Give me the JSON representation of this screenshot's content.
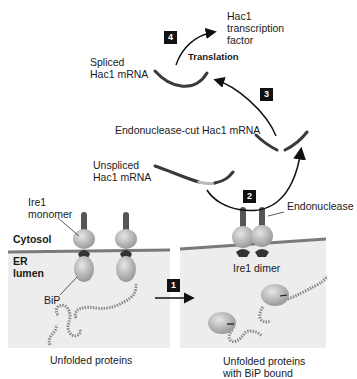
{
  "diagram": {
    "colors": {
      "lumen_fill": "#ececec",
      "membrane": "#7a7a7a",
      "mrna": "#3a3a3a",
      "protein_globe": "#b8b8b8",
      "ire1_stalk": "#555555",
      "step_badge": "#111111"
    },
    "compartments": {
      "cytosol": "Cytosol",
      "er_lumen_line1": "ER",
      "er_lumen_line2": "lumen"
    },
    "labels": {
      "ire1_monomer_line1": "Ire1",
      "ire1_monomer_line2": "monomer",
      "bip": "BiP",
      "unfolded_proteins": "Unfolded proteins",
      "unfolded_bip_line1": "Unfolded proteins",
      "unfolded_bip_line2": "with BiP bound",
      "ire1_dimer": "Ire1 dimer",
      "endonuclease": "Endonuclease",
      "unspliced_line1": "Unspliced",
      "unspliced_line2": "Hac1 mRNA",
      "cut_mrna": "Endonuclease-cut Hac1 mRNA",
      "spliced_line1": "Spliced",
      "spliced_line2": "Hac1 mRNA",
      "translation": "Translation",
      "tf_line1": "Hac1",
      "tf_line2": "transcription",
      "tf_line3": "factor"
    },
    "steps": [
      {
        "number": "1",
        "description": "Unfolded proteins bind BiP, releasing Ire1"
      },
      {
        "number": "2",
        "description": "Ire1 dimer endonuclease cuts Hac1 mRNA"
      },
      {
        "number": "3",
        "description": "Cut mRNA is spliced"
      },
      {
        "number": "4",
        "description": "Translation to Hac1 transcription factor"
      }
    ]
  }
}
